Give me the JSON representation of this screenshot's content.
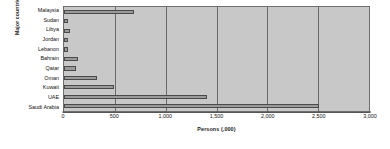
{
  "chart_data": {
    "type": "bar",
    "orientation": "horizontal",
    "title": "",
    "xlabel": "Persons (,000)",
    "ylabel": "Major countries",
    "categories": [
      "Malaysia",
      "Sudan",
      "Libya",
      "Jordan",
      "Lebanon",
      "Bahrain",
      "Qatar",
      "Oman",
      "Kuwait",
      "UAE",
      "Saudi Arabia"
    ],
    "values": [
      685,
      40,
      60,
      35,
      35,
      135,
      115,
      320,
      490,
      1410,
      2510
    ],
    "xlim": [
      0,
      3000
    ],
    "ylim": null,
    "xticks": [
      0,
      500,
      1000,
      1500,
      2000,
      2500,
      3000
    ],
    "xticklabels": [
      "0",
      "500",
      "1,000",
      "1,500",
      "2,000",
      "2,500",
      "3,000"
    ],
    "grid": "vertical",
    "legend": null,
    "colors": {
      "plot_background": "#c8c8c8",
      "bar_fill": "#9a9a9a",
      "bar_edge": "#4a4a4a",
      "gridline": "#6a6a6a",
      "axis": "#555555",
      "text": "#111111"
    }
  }
}
